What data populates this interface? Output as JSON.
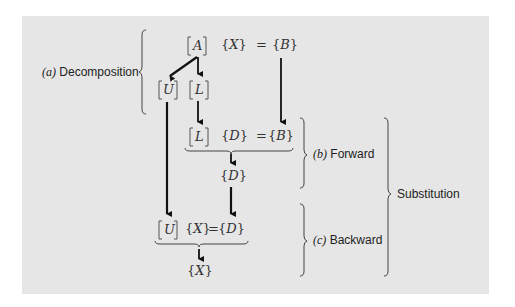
{
  "diagram": {
    "background": "#e6e6e6",
    "ink": "#111111",
    "row1": {
      "matrix_a": "A",
      "vector_x": "X",
      "equals": "=",
      "vector_b": "B"
    },
    "row2": {
      "matrix_u": "U",
      "matrix_l": "L"
    },
    "row3": {
      "matrix_l": "L",
      "vector_d": "D",
      "equals": "=",
      "vector_b": "B"
    },
    "row4": {
      "vector_d": "D"
    },
    "row5": {
      "matrix_u": "U",
      "vector_x": "X",
      "equals": "=",
      "vector_d": "D"
    },
    "row6": {
      "vector_x": "X"
    },
    "labels": {
      "decomposition": {
        "tag": "(a)",
        "text": "Decomposition"
      },
      "forward": {
        "tag": "(b)",
        "text": "Forward"
      },
      "backward": {
        "tag": "(c)",
        "text": "Backward"
      },
      "substitution": {
        "text": "Substitution"
      }
    },
    "arrows": [
      {
        "from": "A",
        "to": "U"
      },
      {
        "from": "A",
        "to": "L"
      },
      {
        "from": "L",
        "to": "[L]{D}={B}"
      },
      {
        "from": "B",
        "to": "[L]{D}={B}"
      },
      {
        "from": "[L]{D}={B}",
        "to": "D"
      },
      {
        "from": "D",
        "to": "[U]{X}={D}"
      },
      {
        "from": "U",
        "to": "[U]{X}={D}"
      },
      {
        "from": "[U]{X}={D}",
        "to": "X"
      }
    ]
  }
}
